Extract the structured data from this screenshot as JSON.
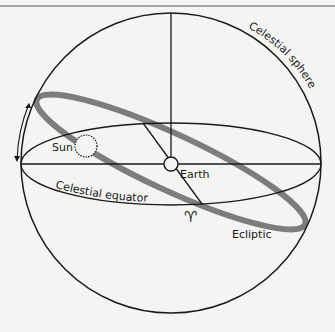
{
  "diagram": {
    "labels": {
      "sphere": "Celestial sphere",
      "sun": "Sun",
      "earth": "Earth",
      "equator": "Celestial equator",
      "ecliptic": "Ecliptic",
      "aries": "♈"
    },
    "colors": {
      "line": "#1a1a1a",
      "ecliptic": "#7d7d7d",
      "background": "#f4f4f2"
    }
  }
}
